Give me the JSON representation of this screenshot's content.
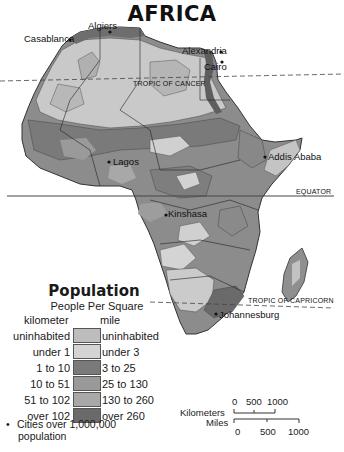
{
  "map": {
    "title": "AFRICA",
    "cities": [
      {
        "name": "Algiers",
        "x": 88,
        "y": 20
      },
      {
        "name": "Casablanca",
        "x": 24,
        "y": 33
      },
      {
        "name": "Alexandria",
        "x": 182,
        "y": 45
      },
      {
        "name": "Cairo",
        "x": 204,
        "y": 61
      },
      {
        "name": "Lagos",
        "x": 113,
        "y": 156
      },
      {
        "name": "Addis Ababa",
        "x": 268,
        "y": 154
      },
      {
        "name": "Kinshasa",
        "x": 168,
        "y": 211
      },
      {
        "name": "Johannesburg",
        "x": 219,
        "y": 309
      }
    ],
    "lines": {
      "tropic_of_cancer": "TROPIC OF CANCER",
      "equator": "EQUATOR",
      "tropic_of_capricorn": "TROPIC OF CAPRICORN"
    }
  },
  "legend": {
    "title": "Population",
    "subtitle": "People Per Square",
    "unit_left": "kilometer",
    "unit_right": "mile",
    "rows": [
      {
        "km": "uninhabited",
        "mi": "uninhabited",
        "color": "#bdbdbd"
      },
      {
        "km": "under 1",
        "mi": "under 3",
        "color": "#d4d4d4"
      },
      {
        "km": "1 to 10",
        "mi": "3 to 25",
        "color": "#7a7a7a"
      },
      {
        "km": "10 to 51",
        "mi": "25 to 130",
        "color": "#999999"
      },
      {
        "km": "51 to 102",
        "mi": "130 to 260",
        "color": "#a8a8a8"
      },
      {
        "km": "over 102",
        "mi": "over  260",
        "color": "#6a6a6a"
      }
    ],
    "cities_note_line1": "Cities over 1,000,000",
    "cities_note_line2": "population",
    "bullet": "•"
  },
  "scale": {
    "km_label": "Kilometers",
    "mi_label": "Miles",
    "km_ticks": [
      "0",
      "500",
      "1000"
    ],
    "mi_ticks": [
      "0",
      "500",
      "1000"
    ]
  }
}
